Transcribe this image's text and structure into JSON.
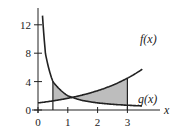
{
  "chart_data": {
    "type": "line",
    "title": "",
    "xlabel": "x",
    "ylabel": "",
    "xlim": [
      0,
      3.6
    ],
    "ylim": [
      0,
      14
    ],
    "x_ticks": [
      0,
      1,
      2,
      3
    ],
    "x_tick_labels": [
      "0",
      "1",
      "2",
      "3"
    ],
    "y_ticks": [
      0,
      4,
      8,
      12
    ],
    "y_tick_labels": [
      "0",
      "4",
      "8",
      "12"
    ],
    "grid": false,
    "series": [
      {
        "name": "f(x)",
        "label": "f(x)",
        "description": "increasing curve",
        "x": [
          0,
          0.5,
          1,
          1.5,
          2,
          2.5,
          3,
          3.5
        ],
        "values": [
          1.0,
          1.28,
          1.65,
          2.12,
          2.72,
          3.49,
          4.48,
          5.75
        ]
      },
      {
        "name": "g(x)",
        "label": "g(x)",
        "description": "decreasing curve",
        "x": [
          0.15,
          0.25,
          0.5,
          1,
          1.5,
          2,
          2.5,
          3,
          3.5
        ],
        "values": [
          13.3,
          8.0,
          4.0,
          2.0,
          1.33,
          1.0,
          0.8,
          0.67,
          0.57
        ]
      }
    ],
    "shaded_region": {
      "between": [
        "f(x)",
        "g(x)"
      ],
      "x_from": 0.5,
      "x_to": 3,
      "color": "#bdbdbd"
    },
    "line_color": "#222222"
  }
}
